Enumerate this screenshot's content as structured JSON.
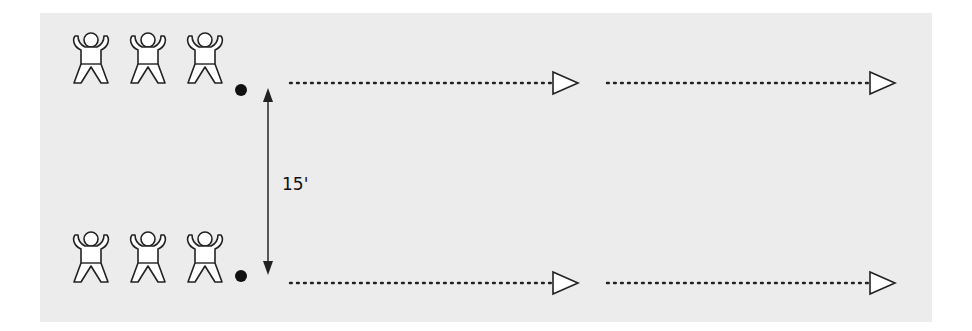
{
  "diagram": {
    "background_color": "#ececec",
    "stroke_color": "#222222",
    "distance_label": "15'",
    "rows": [
      {
        "name": "top-line",
        "players": 3,
        "ball": true,
        "y": 83,
        "arrows": [
          {
            "from_x": 290,
            "to_x": 553,
            "tip_x": 578
          },
          {
            "from_x": 607,
            "to_x": 870,
            "tip_x": 895
          }
        ]
      },
      {
        "name": "bottom-line",
        "players": 3,
        "ball": true,
        "y": 283,
        "arrows": [
          {
            "from_x": 290,
            "to_x": 553,
            "tip_x": 578
          },
          {
            "from_x": 607,
            "to_x": 870,
            "tip_x": 895
          }
        ]
      }
    ],
    "icons": {
      "player": "person-jumping-jack-icon",
      "ball": "ball-icon",
      "direction": "triangle-arrow-icon",
      "distance": "double-headed-arrow-icon"
    }
  }
}
